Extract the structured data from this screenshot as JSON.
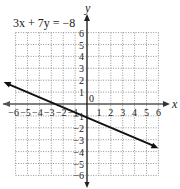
{
  "chart_data": {
    "type": "line",
    "title": "3x + 7y = −8",
    "xlabel": "x",
    "ylabel": "y",
    "xlim": [
      -6,
      6
    ],
    "ylim": [
      -6,
      6
    ],
    "grid": true,
    "x_ticks": [
      "−6",
      "−5",
      "−4",
      "−3",
      "−2",
      "−1",
      "0",
      "1",
      "2",
      "3",
      "4",
      "5",
      "6"
    ],
    "y_ticks": [
      "6",
      "5",
      "4",
      "3",
      "2",
      "1",
      "−1",
      "−2",
      "−3",
      "−4",
      "−5",
      "−6"
    ],
    "series": [
      {
        "name": "3x + 7y = −8",
        "equation": "y = -(3/7)x - 8/7",
        "slope": -0.4286,
        "intercept": -1.1429,
        "x": [
          -7,
          6.0
        ],
        "y": [
          1.857,
          -3.714
        ],
        "arrows": "both"
      }
    ]
  },
  "labels": {
    "equation": "3x + 7y = −8",
    "x_axis": "x",
    "y_axis": "y",
    "origin": "0"
  }
}
